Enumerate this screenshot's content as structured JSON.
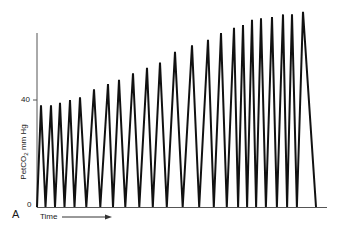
{
  "chart_data": {
    "type": "line",
    "title": "",
    "panel_label": "A",
    "xlabel": "Time",
    "ylabel": "PetCO2 mm Hg",
    "ylabel_display": "PetCO₂ mm Hg",
    "yticks": [
      0,
      40
    ],
    "ylim": [
      0,
      65
    ],
    "grid": false,
    "legend": null,
    "series": [
      {
        "name": "PetCO2",
        "peaks_x_px": [
          41,
          51,
          60,
          70,
          80,
          94,
          108,
          119,
          133,
          147,
          160,
          175,
          192,
          208,
          221,
          234,
          243,
          252,
          261,
          272,
          283,
          292,
          303
        ],
        "peak_values": [
          38,
          38,
          39,
          40,
          41,
          44,
          46,
          47.5,
          50,
          52,
          54,
          58,
          60.5,
          62.5,
          65,
          67,
          68,
          70,
          70.5,
          71,
          72,
          72,
          73
        ],
        "trough_value": 0
      }
    ]
  },
  "labels": {
    "panel": "A",
    "tick_0": "0",
    "tick_40": "40",
    "ylabel_prefix": "PetCO",
    "ylabel_sub": "2",
    "ylabel_suffix": " mm Hg",
    "xlabel": "Time"
  },
  "colors": {
    "trace": "#111111",
    "axis": "#555555",
    "text": "#1a1a1a"
  }
}
